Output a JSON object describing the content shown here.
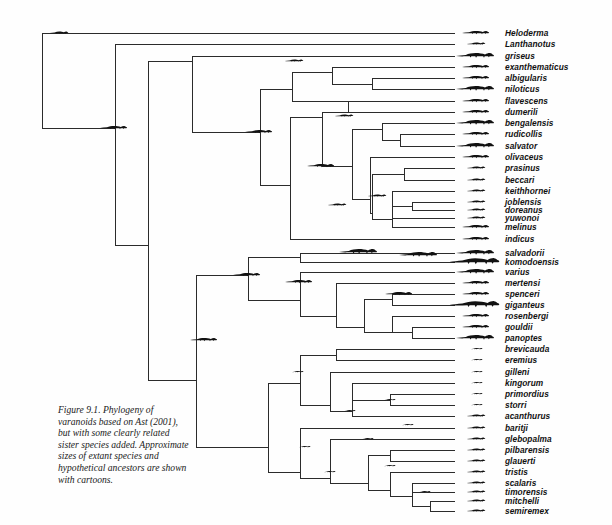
{
  "figure": {
    "caption": "Figure 9.1. Phylogeny of varanoids based on Ast (2001), but with some clearly related sister species added. Approximate sizes of extant species and hypothetical ancestors are shown with cartoons.",
    "caption_lines": [
      "Figure 9.1. Phylogeny of",
      "varanoids based on Ast (2001),",
      "but with some clearly related",
      "sister species added. Approximate",
      "sizes of extant species and",
      "hypothetical ancestors are shown",
      "with cartoons."
    ],
    "line_color": "#2b2b2b",
    "silhouette_color": "#111111",
    "text_color": "#111111"
  },
  "chart_data": {
    "type": "tree",
    "layout": "rectangular-cladogram",
    "tip_count": 39,
    "taxa": [
      {
        "index": 0,
        "label": "Heloderma",
        "y": 33,
        "tip_x": 455,
        "size": "medium"
      },
      {
        "index": 1,
        "label": "Lanthanotus",
        "y": 44,
        "tip_x": 455,
        "size": "small"
      },
      {
        "index": 2,
        "label": "griseus",
        "y": 56,
        "tip_x": 455,
        "size": "large"
      },
      {
        "index": 3,
        "label": "exanthematicus",
        "y": 67,
        "tip_x": 455,
        "size": "medium"
      },
      {
        "index": 4,
        "label": "albigularis",
        "y": 78,
        "tip_x": 455,
        "size": "medium"
      },
      {
        "index": 5,
        "label": "niloticus",
        "y": 89,
        "tip_x": 455,
        "size": "large"
      },
      {
        "index": 6,
        "label": "flavescens",
        "y": 101,
        "tip_x": 455,
        "size": "medium"
      },
      {
        "index": 7,
        "label": "dumerili",
        "y": 112,
        "tip_x": 455,
        "size": "medium"
      },
      {
        "index": 8,
        "label": "bengalensis",
        "y": 123,
        "tip_x": 455,
        "size": "large"
      },
      {
        "index": 9,
        "label": "rudicollis",
        "y": 134,
        "tip_x": 455,
        "size": "medium"
      },
      {
        "index": 10,
        "label": "salvator",
        "y": 146,
        "tip_x": 455,
        "size": "large"
      },
      {
        "index": 11,
        "label": "olivaceus",
        "y": 157,
        "tip_x": 455,
        "size": "medium"
      },
      {
        "index": 12,
        "label": "prasinus",
        "y": 168,
        "tip_x": 455,
        "size": "small"
      },
      {
        "index": 13,
        "label": "beccari",
        "y": 180,
        "tip_x": 455,
        "size": "small"
      },
      {
        "index": 14,
        "label": "keithhornei",
        "y": 191,
        "tip_x": 455,
        "size": "small"
      },
      {
        "index": 15,
        "label": "joblensis",
        "y": 202,
        "tip_x": 455,
        "size": "small"
      },
      {
        "index": 16,
        "label": "doreanus",
        "y": 210,
        "tip_x": 455,
        "size": "small"
      },
      {
        "index": 17,
        "label": "yuwonoi",
        "y": 218,
        "tip_x": 455,
        "size": "small"
      },
      {
        "index": 18,
        "label": "melinus",
        "y": 227,
        "tip_x": 455,
        "size": "medium"
      },
      {
        "index": 19,
        "label": "indicus",
        "y": 239,
        "tip_x": 455,
        "size": "medium"
      },
      {
        "index": 20,
        "label": "salvadorii",
        "y": 253,
        "tip_x": 455,
        "size": "large"
      },
      {
        "index": 21,
        "label": "komodoensis",
        "y": 262,
        "tip_x": 455,
        "size": "xlarge"
      },
      {
        "index": 22,
        "label": "varius",
        "y": 272,
        "tip_x": 455,
        "size": "large"
      },
      {
        "index": 23,
        "label": "mertensi",
        "y": 283,
        "tip_x": 455,
        "size": "medium"
      },
      {
        "index": 24,
        "label": "spenceri",
        "y": 294,
        "tip_x": 455,
        "size": "medium"
      },
      {
        "index": 25,
        "label": "giganteus",
        "y": 305,
        "tip_x": 455,
        "size": "xlarge"
      },
      {
        "index": 26,
        "label": "rosenbergi",
        "y": 316,
        "tip_x": 455,
        "size": "medium"
      },
      {
        "index": 27,
        "label": "gouldii",
        "y": 327,
        "tip_x": 455,
        "size": "medium"
      },
      {
        "index": 28,
        "label": "panoptes",
        "y": 338,
        "tip_x": 455,
        "size": "large"
      },
      {
        "index": 29,
        "label": "brevicauda",
        "y": 349,
        "tip_x": 455,
        "size": "tiny"
      },
      {
        "index": 30,
        "label": "eremius",
        "y": 360,
        "tip_x": 455,
        "size": "tiny"
      },
      {
        "index": 31,
        "label": "gilleni",
        "y": 372,
        "tip_x": 455,
        "size": "tiny"
      },
      {
        "index": 32,
        "label": "kingorum",
        "y": 383,
        "tip_x": 455,
        "size": "tiny"
      },
      {
        "index": 33,
        "label": "primordius",
        "y": 394,
        "tip_x": 455,
        "size": "tiny"
      },
      {
        "index": 34,
        "label": "storri",
        "y": 405,
        "tip_x": 455,
        "size": "tiny"
      },
      {
        "index": 35,
        "label": "acanthurus",
        "y": 416,
        "tip_x": 455,
        "size": "small"
      },
      {
        "index": 36,
        "label": "baritji",
        "y": 428,
        "tip_x": 455,
        "size": "small"
      },
      {
        "index": 37,
        "label": "glebopalma",
        "y": 439,
        "tip_x": 455,
        "size": "small"
      },
      {
        "index": 38,
        "label": "pilbarensis",
        "y": 450,
        "tip_x": 455,
        "size": "small"
      },
      {
        "index": 39,
        "label": "glauerti",
        "y": 461,
        "tip_x": 455,
        "size": "small"
      },
      {
        "index": 40,
        "label": "tristis",
        "y": 472,
        "tip_x": 455,
        "size": "small"
      },
      {
        "index": 41,
        "label": "scalaris",
        "y": 483,
        "tip_x": 455,
        "size": "small"
      },
      {
        "index": 42,
        "label": "timorensis",
        "y": 492,
        "tip_x": 455,
        "size": "small"
      },
      {
        "index": 43,
        "label": "mitchelli",
        "y": 501,
        "tip_x": 455,
        "size": "small"
      },
      {
        "index": 44,
        "label": "semiremex",
        "y": 511,
        "tip_x": 455,
        "size": "small"
      }
    ],
    "label_x": 505,
    "silhouette_x": 455,
    "ancestor_silhouettes": [
      {
        "x": 60,
        "y": 33,
        "size": "small"
      },
      {
        "x": 115,
        "y": 128,
        "size": "medium"
      },
      {
        "x": 205,
        "y": 340,
        "size": "medium"
      },
      {
        "x": 260,
        "y": 132,
        "size": "medium"
      },
      {
        "x": 295,
        "y": 61,
        "size": "small"
      },
      {
        "x": 248,
        "y": 275,
        "size": "medium"
      },
      {
        "x": 322,
        "y": 166,
        "size": "medium"
      },
      {
        "x": 300,
        "y": 282,
        "size": "medium"
      },
      {
        "x": 345,
        "y": 116,
        "size": "small"
      },
      {
        "x": 338,
        "y": 205,
        "size": "small"
      },
      {
        "x": 378,
        "y": 196,
        "size": "small"
      },
      {
        "x": 420,
        "y": 255,
        "size": "large"
      },
      {
        "x": 360,
        "y": 252,
        "size": "large"
      },
      {
        "x": 400,
        "y": 294,
        "size": "medium"
      },
      {
        "x": 298,
        "y": 372,
        "size": "tiny"
      },
      {
        "x": 350,
        "y": 411,
        "size": "tiny"
      },
      {
        "x": 305,
        "y": 447,
        "size": "tiny"
      },
      {
        "x": 368,
        "y": 439,
        "size": "tiny"
      },
      {
        "x": 330,
        "y": 472,
        "size": "tiny"
      },
      {
        "x": 390,
        "y": 466,
        "size": "tiny"
      },
      {
        "x": 425,
        "y": 492,
        "size": "tiny"
      },
      {
        "x": 390,
        "y": 400,
        "size": "tiny"
      },
      {
        "x": 408,
        "y": 425,
        "size": "tiny"
      }
    ]
  }
}
